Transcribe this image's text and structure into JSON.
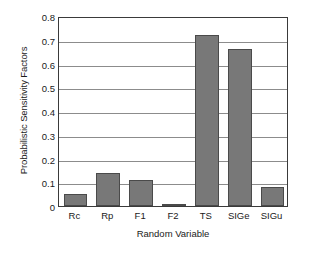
{
  "chart_data": {
    "type": "bar",
    "title": "",
    "xlabel": "Random Variable",
    "ylabel": "Probabilistic Sensitivity Factors",
    "categories": [
      "Rc",
      "Rp",
      "F1",
      "F2",
      "TS",
      "SIGe",
      "SIGu"
    ],
    "values": [
      0.05,
      0.14,
      0.11,
      0.01,
      0.72,
      0.66,
      0.08
    ],
    "ylim": [
      0,
      0.8
    ],
    "yticks": [
      0,
      0.1,
      0.2,
      0.3,
      0.4,
      0.5,
      0.6,
      0.7,
      0.8
    ],
    "ytick_labels": [
      "0",
      "0.1",
      "0.2",
      "0.3",
      "0.4",
      "0.5",
      "0.6",
      "0.7",
      "0.8"
    ],
    "grid": "horizontal",
    "legend": "none",
    "bar_color": "#787878",
    "bar_edge_color": "#4a4a4a",
    "grid_color": "#8c8c8c",
    "axis_color": "#3a3a3a",
    "background_color": "#ffffff"
  }
}
